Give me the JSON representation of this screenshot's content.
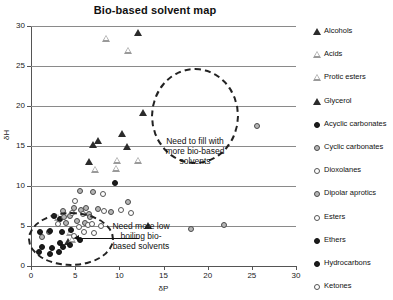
{
  "chart_data": {
    "type": "scatter",
    "title": "Bio-based solvent map",
    "xlabel": "δP",
    "ylabel": "δH",
    "xlim": [
      0,
      30
    ],
    "ylim": [
      0,
      30
    ],
    "xticks": [
      "0",
      "5",
      "10",
      "15",
      "20",
      "25",
      "30"
    ],
    "yticks": [
      "0",
      "5",
      "10",
      "15",
      "20",
      "25",
      "30"
    ],
    "grid": "horizontal",
    "legend_position": "right",
    "series": [
      {
        "name": "Alcohols",
        "marker": "triangle-filled",
        "points": [
          [
            7.0,
            15.2
          ],
          [
            7.6,
            15.8
          ],
          [
            6.6,
            13.1
          ],
          [
            10.9,
            15.0
          ],
          [
            12.7,
            19.3
          ],
          [
            10.3,
            16.6
          ],
          [
            13.2,
            5.1
          ],
          [
            4.2,
            3.1
          ]
        ]
      },
      {
        "name": "Acids",
        "marker": "triangle-open",
        "points": [
          [
            8.5,
            28.5
          ],
          [
            11.0,
            27.0
          ],
          [
            7.3,
            12.1
          ],
          [
            9.6,
            12.2
          ],
          [
            9.7,
            13.2
          ],
          [
            12.1,
            13.3
          ],
          [
            3.1,
            6.1
          ]
        ]
      },
      {
        "name": "Protic esters",
        "marker": "triangle-open",
        "points": [
          [
            4.4,
            4.2
          ],
          [
            4.6,
            3.4
          ]
        ]
      },
      {
        "name": "Glycerol",
        "marker": "triangle-filled",
        "points": [
          [
            12.1,
            29.3
          ]
        ]
      },
      {
        "name": "Acyclic carbonates",
        "marker": "circle-filled",
        "points": [
          [
            9.5,
            10.4
          ],
          [
            2.6,
            6.3
          ],
          [
            3.3,
            5.9
          ]
        ]
      },
      {
        "name": "Cyclic carbonates",
        "marker": "circle-gray",
        "points": [
          [
            5.6,
            9.4
          ],
          [
            7.0,
            9.2
          ],
          [
            4.9,
            7.3
          ],
          [
            5.7,
            7.0
          ],
          [
            6.2,
            7.2
          ],
          [
            3.6,
            6.9
          ],
          [
            3.7,
            6.1
          ],
          [
            4.4,
            6.3
          ],
          [
            6.6,
            6.5
          ],
          [
            6.7,
            6.1
          ],
          [
            7.6,
            7.1
          ],
          [
            5.2,
            5.6
          ],
          [
            6.1,
            5.4
          ],
          [
            4.0,
            5.4
          ],
          [
            1.3,
            3.6
          ],
          [
            2.0,
            4.2
          ]
        ]
      },
      {
        "name": "Dioxolanes",
        "marker": "circle-open",
        "points": [
          [
            8.2,
            9.0
          ],
          [
            10.2,
            7.0
          ],
          [
            11.3,
            6.6
          ],
          [
            8.3,
            6.9
          ],
          [
            6.4,
            5.1
          ],
          [
            7.9,
            5.0
          ]
        ]
      },
      {
        "name": "Dipolar aprotics",
        "marker": "circle-gray",
        "points": [
          [
            25.6,
            17.5
          ],
          [
            21.9,
            5.1
          ],
          [
            18.1,
            4.6
          ],
          [
            11.0,
            8.0
          ],
          [
            9.0,
            6.8
          ]
        ]
      },
      {
        "name": "Esters",
        "marker": "circle-open",
        "points": [
          [
            5.0,
            8.1
          ],
          [
            4.6,
            6.6
          ],
          [
            5.9,
            6.5
          ],
          [
            3.0,
            5.2
          ],
          [
            5.4,
            4.9
          ],
          [
            6.9,
            5.2
          ]
        ]
      },
      {
        "name": "Ethers",
        "marker": "circle-filled",
        "points": [
          [
            1.0,
            4.3
          ],
          [
            2.2,
            4.4
          ],
          [
            3.5,
            4.3
          ],
          [
            4.5,
            4.5
          ],
          [
            3.3,
            2.9
          ],
          [
            4.4,
            2.6
          ],
          [
            5.6,
            3.3
          ],
          [
            1.3,
            2.4
          ],
          [
            2.4,
            2.3
          ],
          [
            3.6,
            2.4
          ]
        ]
      },
      {
        "name": "Hydrocarbons",
        "marker": "circle-filled",
        "points": [
          [
            0.9,
            1.8
          ],
          [
            2.1,
            1.5
          ],
          [
            3.2,
            1.7
          ]
        ]
      },
      {
        "name": "Ketones",
        "marker": "circle-open",
        "points": [
          [
            6.0,
            4.2
          ],
          [
            7.1,
            4.1
          ],
          [
            4.9,
            3.8
          ]
        ]
      }
    ],
    "annotations": [
      {
        "id": "fill-gap",
        "text": "Need to fill with more bio-based solvents",
        "shape": "dashed-ellipse"
      },
      {
        "id": "low-boiling",
        "text": "Need more low boiling bio-based solvents",
        "shape": "dashed-ellipse-with-arrow"
      }
    ]
  },
  "legend": {
    "items": [
      {
        "label": "Alcohols",
        "marker": "triangle-filled"
      },
      {
        "label": "Acids",
        "marker": "triangle-open"
      },
      {
        "label": "Protic esters",
        "marker": "triangle-open"
      },
      {
        "label": "Glycerol",
        "marker": "triangle-filled"
      },
      {
        "label": "Acyclic carbonates",
        "marker": "circle-filled"
      },
      {
        "label": "Cyclic carbonates",
        "marker": "circle-gray"
      },
      {
        "label": "Dioxolanes",
        "marker": "circle-open"
      },
      {
        "label": "Dipolar aprotics",
        "marker": "circle-gray"
      },
      {
        "label": "Esters",
        "marker": "circle-open"
      },
      {
        "label": "Ethers",
        "marker": "circle-filled"
      },
      {
        "label": "Hydrocarbons",
        "marker": "circle-filled"
      },
      {
        "label": "Ketones",
        "marker": "circle-open"
      }
    ]
  },
  "annotation_text": {
    "fill_gap_line1": "Need to fill with",
    "fill_gap_line2": "more bio-based",
    "fill_gap_line3": "solvents",
    "low_boiling_line1": "Need more low",
    "low_boiling_line2": "boiling bio-",
    "low_boiling_line3": "based solvents"
  },
  "colors": {
    "marker_dark": "#1c1c1c",
    "marker_gray": "#b6b6b6",
    "gridline": "#8a8a8a",
    "axis": "#555555",
    "text": "#111111"
  }
}
